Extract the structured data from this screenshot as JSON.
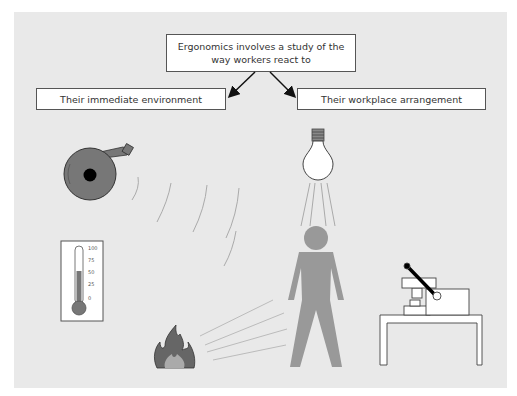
{
  "diagram": {
    "title": "Ergonomics involves a study of the way workers react to",
    "top_box": {
      "line1": "Ergonomics involves a study of the",
      "line2": "way workers react to"
    },
    "branches": [
      {
        "label": "Their immediate environment"
      },
      {
        "label": "Their workplace arrangement"
      }
    ],
    "illustrations": [
      {
        "name": "bell",
        "meaning": "noise"
      },
      {
        "name": "light-bulb",
        "meaning": "lighting"
      },
      {
        "name": "thermometer",
        "meaning": "temperature",
        "scale": [
          "100",
          "75",
          "50",
          "25",
          "0"
        ]
      },
      {
        "name": "fire",
        "meaning": "heat"
      },
      {
        "name": "worker-figure",
        "meaning": "worker"
      },
      {
        "name": "machine-on-bench",
        "meaning": "workplace arrangement"
      }
    ]
  }
}
